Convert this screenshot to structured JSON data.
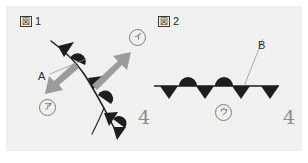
{
  "figure": {
    "kind": "geology-structural-diagram",
    "background_color": "#f2f2f0",
    "ink_color": "#1d1d1d",
    "arrow_color": "#9b9b9b",
    "leader_color": "#8a8a8a"
  },
  "panel1": {
    "caption": {
      "boxed_char": "図",
      "number": "1"
    },
    "label_a": "A",
    "marker_a": {
      "glyph": "ア",
      "name": "circled-a-marker"
    },
    "marker_i": {
      "glyph": "イ",
      "name": "circled-i-marker"
    },
    "dip_symbol": "4",
    "arrows": [
      {
        "name": "arrow-up-right",
        "points_to": "イ"
      },
      {
        "name": "arrow-down-left",
        "points_to": "ア"
      }
    ],
    "fault_line": {
      "name": "curved-fault-trace",
      "teeth_count": 4,
      "bump_count": 3
    }
  },
  "panel2": {
    "caption": {
      "boxed_char": "図",
      "number": "2"
    },
    "label_b": "B",
    "marker_u": {
      "glyph": "ウ",
      "name": "circled-u-marker"
    },
    "dip_symbol": "4",
    "fault_line": {
      "name": "horizontal-fault-trace",
      "teeth_count": 4,
      "bump_count": 2
    }
  }
}
